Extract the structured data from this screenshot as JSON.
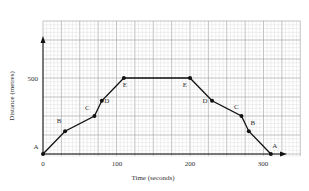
{
  "chart_data": {
    "type": "line",
    "title": "",
    "xlabel": "Time (seconds)",
    "ylabel": "Distance (metres)",
    "xlim": [
      0,
      350
    ],
    "ylim": [
      0,
      875
    ],
    "x_ticks": [
      0,
      100,
      200,
      300
    ],
    "y_ticks": [
      500
    ],
    "grid": true,
    "grid_major": {
      "x": 25,
      "y": 125
    },
    "grid_minor": {
      "x": 5,
      "y": 25
    },
    "series": [
      {
        "name": "journey",
        "x": [
          0,
          30,
          70,
          80,
          110,
          200,
          230,
          270,
          280,
          310
        ],
        "y": [
          0,
          150,
          250,
          350,
          500,
          500,
          350,
          250,
          150,
          0
        ],
        "point_labels": [
          "A",
          "B",
          "C",
          "D",
          "E",
          "E",
          "D",
          "C",
          "B",
          "A"
        ]
      }
    ],
    "colors": {
      "line": "#111111",
      "grid_major": "#9a9a9a",
      "grid_minor": "#d9d9d9"
    }
  },
  "labels": {
    "xlabel": "Time (seconds)",
    "ylabel": "Distance (metres)",
    "x0": "0",
    "x100": "100",
    "x200": "200",
    "x300": "300",
    "y500": "500"
  }
}
